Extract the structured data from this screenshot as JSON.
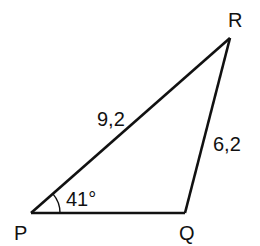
{
  "diagram": {
    "type": "triangle",
    "stroke_color": "#111111",
    "vertices": [
      {
        "label": "P",
        "x": 31,
        "y": 213
      },
      {
        "label": "Q",
        "x": 185,
        "y": 213
      },
      {
        "label": "R",
        "x": 230,
        "y": 38
      }
    ],
    "sides": [
      {
        "from": "P",
        "to": "R",
        "label": "9,2"
      },
      {
        "from": "Q",
        "to": "R",
        "label": "6,2"
      },
      {
        "from": "P",
        "to": "Q",
        "label": ""
      }
    ],
    "angles": [
      {
        "at": "P",
        "label": "41°"
      }
    ]
  },
  "labels": {
    "P": "P",
    "Q": "Q",
    "R": "R",
    "side_PR": "9,2",
    "side_QR": "6,2",
    "angle_P": "41°"
  }
}
